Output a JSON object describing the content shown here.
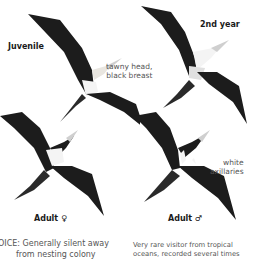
{
  "labels": {
    "juvenile": "Juvenile",
    "second_year": "2nd year",
    "adult_female": "Adult ♀",
    "adult_male": "Adult ♂"
  },
  "annotations": {
    "tawny_line1": "tawny head,",
    "tawny_line2": "black breast",
    "white_line1": "white",
    "white_line2": "axillaries"
  },
  "text": {
    "voice_line1": "OICE: Generally silent away",
    "voice_line2": "from nesting colony",
    "status_line1": "Very rare visitor from tropical",
    "status_line2": "oceans, recorded several times"
  },
  "colors": {
    "bird_dark": "#1c1c1c",
    "bird_white": "#f4f4f4",
    "text_gray": "#555555"
  }
}
